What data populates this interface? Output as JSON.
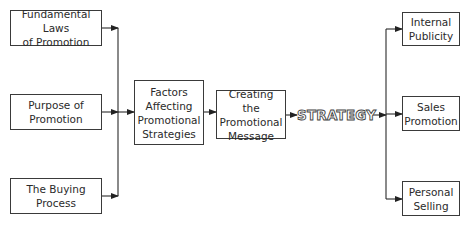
{
  "diagram": {
    "inputs": [
      {
        "label": "Fundamental Laws\nof Promotion"
      },
      {
        "label": "Purpose of\nPromotion"
      },
      {
        "label": "The Buying\nProcess"
      }
    ],
    "factors": {
      "label": "Factors\nAffecting\nPromotional\nStrategies"
    },
    "message": {
      "label": "Creating the\nPromotional\nMessage"
    },
    "strategy": {
      "label": "STRATEGY"
    },
    "outputs": [
      {
        "label": "Internal\nPublicity"
      },
      {
        "label": "Sales\nPromotion"
      },
      {
        "label": "Personal\nSelling"
      }
    ],
    "colors": {
      "line": "#2a2a2a",
      "border": "#3a3a3a",
      "text": "#2a2a2a"
    }
  }
}
